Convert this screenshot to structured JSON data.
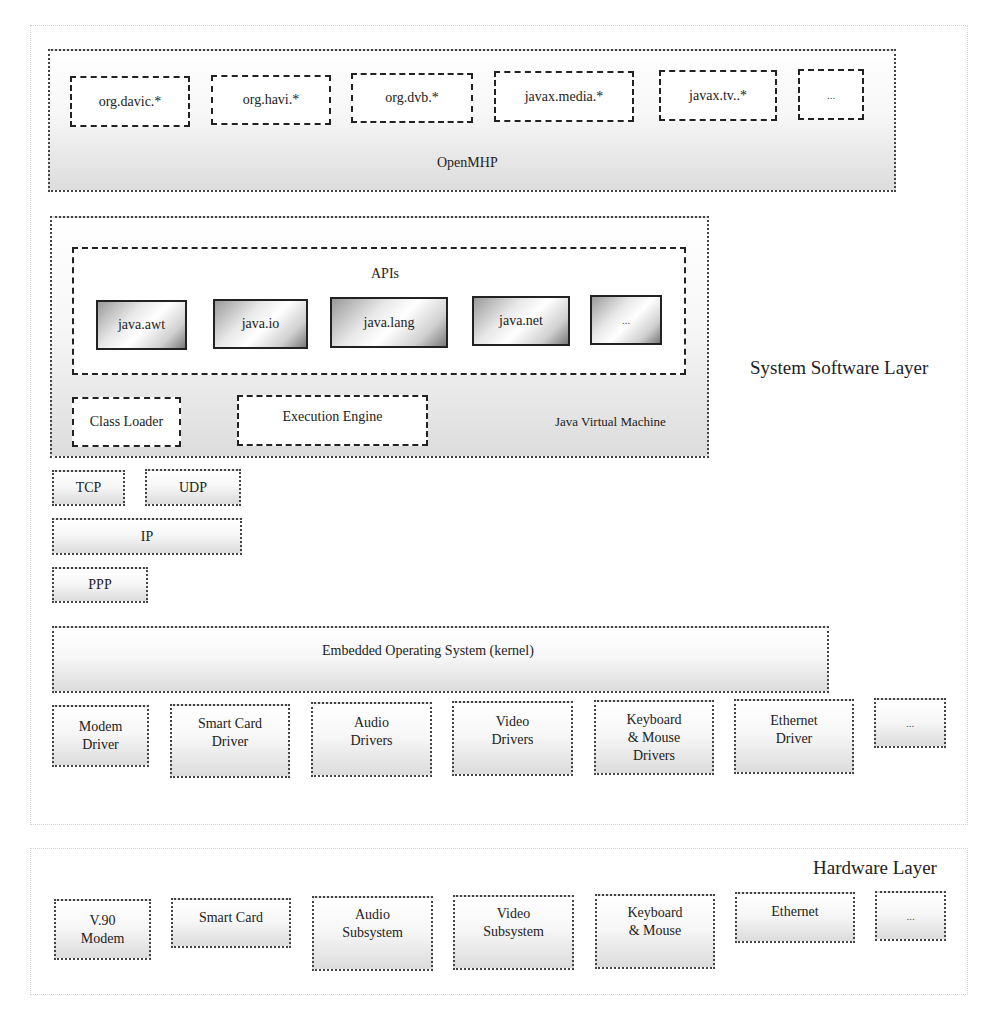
{
  "diagram": {
    "system_software_layer": {
      "label": "System Software Layer",
      "openmhp": {
        "label": "OpenMHP",
        "packages": [
          "org.davic.*",
          "org.havi.*",
          "org.dvb.*",
          "javax.media.*",
          "javax.tv..*",
          "..."
        ]
      },
      "jvm": {
        "label": "Java Virtual Machine",
        "apis": {
          "label": "APIs",
          "items": [
            "java.awt",
            "java.io",
            "java.lang",
            "java.net",
            "..."
          ]
        },
        "class_loader": "Class Loader",
        "execution_engine": "Execution Engine"
      },
      "network": {
        "tcp": "TCP",
        "udp": "UDP",
        "ip": "IP",
        "ppp": "PPP"
      },
      "kernel": "Embedded Operating System (kernel)",
      "drivers": [
        "Modem\nDriver",
        "Smart Card\nDriver",
        "Audio\nDrivers",
        "Video\nDrivers",
        "Keyboard\n& Mouse\nDrivers",
        "Ethernet\nDriver",
        "..."
      ]
    },
    "hardware_layer": {
      "label": "Hardware Layer",
      "components": [
        "V.90\nModem",
        "Smart Card",
        "Audio\nSubsystem",
        "Video\nSubsystem",
        "Keyboard\n& Mouse",
        "Ethernet",
        "..."
      ]
    }
  }
}
